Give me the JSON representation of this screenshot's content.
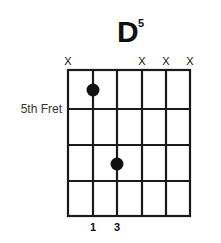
{
  "chord": {
    "name": "D",
    "superscript": "5",
    "start_fret_label": "5th Fret",
    "start_fret": 5,
    "strings": 6,
    "frets_shown": 4
  },
  "string_markers": [
    {
      "string": 1,
      "label": "X"
    },
    {
      "string": 2,
      "label": ""
    },
    {
      "string": 3,
      "label": ""
    },
    {
      "string": 4,
      "label": "X"
    },
    {
      "string": 5,
      "label": "X"
    },
    {
      "string": 6,
      "label": "X"
    }
  ],
  "dots": [
    {
      "string": 2,
      "fret": 1
    },
    {
      "string": 3,
      "fret": 3
    }
  ],
  "fingers": [
    {
      "string": 2,
      "label": "1"
    },
    {
      "string": 3,
      "label": "3"
    }
  ],
  "colors": {
    "line": "#1a1a1a",
    "dot": "#111111",
    "background": "#ffffff"
  }
}
